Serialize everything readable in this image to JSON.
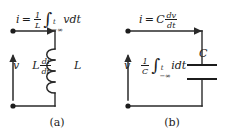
{
  "figure": {
    "background_color": "#ffffff",
    "ink_color": "#1c1c1c",
    "width": 229,
    "height": 138
  },
  "panels": [
    {
      "id": "a",
      "caption": "(a)",
      "element": "inductor",
      "component_label": "L",
      "current_equation": {
        "lhs": "i",
        "relation": "=",
        "coefficient_numerator": "1",
        "coefficient_denominator": "L",
        "integral_upper_limit": "t",
        "integral_lower_limit": "−∞",
        "integrand": "v",
        "differential": "dt",
        "plain_text": "i = (1/L) ∫ from -∞ to t of v dt"
      },
      "voltage_equation": {
        "terminal_label": "v",
        "expression_coefficient": "L",
        "derivative_numerator": "di",
        "derivative_denominator": "dt",
        "plain_text": "v | L di/dt"
      },
      "terminal_dots": 2,
      "current_arrow_direction": "right",
      "voltage_arrow_direction": "up",
      "coil_turns": 4
    },
    {
      "id": "b",
      "caption": "(b)",
      "element": "capacitor",
      "component_label": "C",
      "current_equation": {
        "lhs": "i",
        "relation": "=",
        "coefficient": "C",
        "derivative_numerator": "dv",
        "derivative_denominator": "dt",
        "plain_text": "i = C dv/dt"
      },
      "voltage_equation": {
        "terminal_label": "v",
        "coefficient_numerator": "1",
        "coefficient_denominator": "C",
        "integral_upper_limit": "t",
        "integral_lower_limit": "−∞",
        "integrand": "i",
        "differential": "dt",
        "plain_text": "v | (1/C) ∫ from -∞ to t of i dt"
      },
      "terminal_dots": 2,
      "current_arrow_direction": "right",
      "voltage_arrow_direction": "up",
      "capacitor_plates": 2
    }
  ],
  "glyphs": {
    "integral": "∫",
    "minus_infinity": "−∞",
    "equals": "="
  }
}
